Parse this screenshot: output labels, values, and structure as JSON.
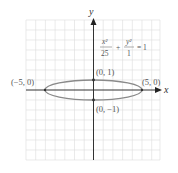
{
  "diagram": {
    "equation": {
      "x_numerator": "x²",
      "x_denominator": "25",
      "plus": "+",
      "y_numerator": "y²",
      "y_denominator": "1",
      "equals": "= 1"
    },
    "axes": {
      "x_label": "x",
      "y_label": "y"
    },
    "points": [
      {
        "label": "(−5, 0)",
        "x": -5,
        "y": 0
      },
      {
        "label": "(5, 0)",
        "x": 5,
        "y": 0
      },
      {
        "label": "(0, 1)",
        "x": 0,
        "y": 1
      },
      {
        "label": "(0, −1)",
        "x": 0,
        "y": -1
      }
    ],
    "ellipse": {
      "a": 5,
      "b": 1,
      "center": [
        0,
        0
      ]
    },
    "colors": {
      "grid": "#d9d9d9",
      "axes": "#333333",
      "ellipse": "#8a8a8a",
      "labels": "#555555"
    }
  }
}
